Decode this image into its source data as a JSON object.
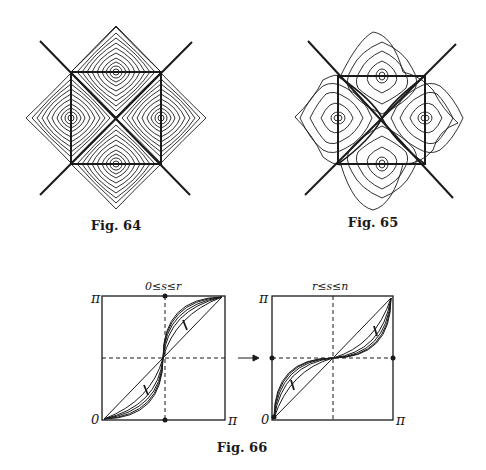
{
  "figures": [
    {
      "id": "fig64",
      "caption": "Fig. 64"
    },
    {
      "id": "fig65",
      "caption": "Fig. 65"
    },
    {
      "id": "fig66",
      "caption": "Fig. 66",
      "left_panel": {
        "title": "0≤s≤r",
        "y_top": "π",
        "y_bottom": "0",
        "x_right": "π"
      },
      "right_panel": {
        "title": "r≤s≤n",
        "y_top": "π",
        "y_bottom": "0",
        "x_right": "π"
      },
      "arrow": "→"
    }
  ]
}
